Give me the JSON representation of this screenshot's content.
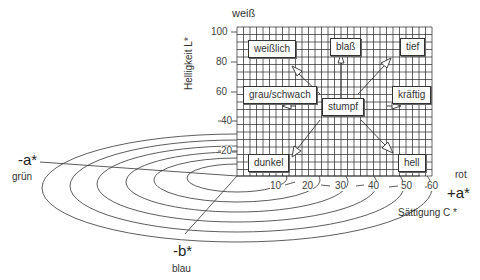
{
  "title_top": "weiß",
  "y_axis": {
    "label": "Helligkeit L*",
    "ticks": [
      "100",
      "80",
      "60",
      "40",
      "20"
    ]
  },
  "x_axis": {
    "label": "Sättigung C *",
    "ticks": [
      "10",
      "20",
      "30",
      "40",
      "50",
      "60"
    ]
  },
  "axes_labels": {
    "plus_a": "+a*",
    "plus_a_name": "rot",
    "minus_a": "-a*",
    "minus_a_name": "grün",
    "minus_b": "-b*",
    "minus_b_name": "blau"
  },
  "boxes": {
    "center": "stumpf",
    "top_left": "weißlich",
    "top_center": "blaß",
    "top_right": "tief",
    "middle_left": "grau/schwach",
    "middle_right": "kräftig",
    "bottom_left": "dunkel",
    "bottom_right": "hell"
  },
  "colors": {
    "line": "#333333",
    "grid": "#222222",
    "background": "#ffffff"
  }
}
